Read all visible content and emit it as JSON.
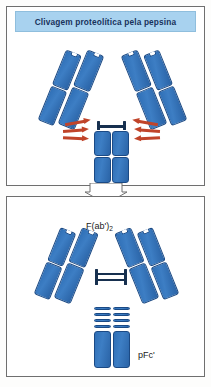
{
  "figure": {
    "header": {
      "title": "Clivagem proteolítica pela pepsina",
      "background_color": "#a8d2ef",
      "text_color": "#18335c"
    },
    "palette": {
      "domain_blue": "#2f6fb6",
      "domain_border": "#1b4a85",
      "cleavage_red": "#c0442a",
      "disulfide_dark": "#17304f",
      "panel_border": "#6f6f6f",
      "panel_background": "#ffffff"
    },
    "panels": [
      {
        "name": "intact-antibody-panel",
        "caption": "",
        "molecule": "intact immunoglobulin (IgG)",
        "cleavage_arrows": 6,
        "arrow_color": "#c0442a"
      },
      {
        "name": "pepsin-fragments-panel",
        "fragments": [
          {
            "name": "fab2-fragment",
            "label": "F(ab')",
            "label_sub": "2"
          },
          {
            "name": "pfc-fragment",
            "label": "pFc'",
            "label_sub": ""
          }
        ]
      }
    ],
    "process_arrow": {
      "name": "process-arrow",
      "direction": "down",
      "fill": "#ffffff",
      "stroke": "#6f6f6f"
    }
  }
}
